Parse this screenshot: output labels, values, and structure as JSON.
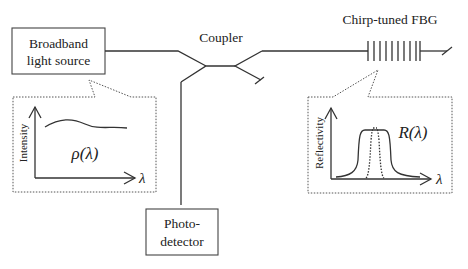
{
  "diagram": {
    "source_box": {
      "line1": "Broadband",
      "line2": "light source"
    },
    "coupler_label": "Coupler",
    "fbg_label": "Chirp-tuned FBG",
    "detector_box": {
      "line1": "Photo-",
      "line2": "detector"
    },
    "source_inset": {
      "y_axis_label": "Intensity",
      "x_axis_symbol": "λ",
      "curve_label": "ρ(λ)"
    },
    "fbg_inset": {
      "y_axis_label": "Reflectivity",
      "x_axis_symbol": "λ",
      "curve_label": "R(λ)"
    },
    "colors": {
      "stroke": "#333333",
      "text": "#222222",
      "background": "#ffffff"
    }
  }
}
